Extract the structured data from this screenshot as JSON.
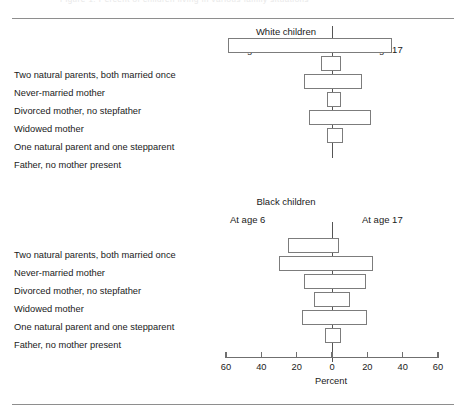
{
  "figure": {
    "faint_header": "Figure 1. Percent of children living in various family situations",
    "axis_title": "Percent"
  },
  "categories": [
    "Two natural parents, both married once",
    "Never-married mother",
    "Divorced mother, no stepfather",
    "Widowed mother",
    "One natural parent and one stepparent",
    "Father, no mother present"
  ],
  "panels": [
    {
      "key": "white",
      "title": "White children",
      "left_label": "At age 6",
      "right_label": "At age 17"
    },
    {
      "key": "black",
      "title": "Black children",
      "left_label": "At age 6",
      "right_label": "At age 17"
    }
  ],
  "axis": {
    "tick_labels": [
      "60",
      "40",
      "20",
      "0",
      "20",
      "40",
      "60"
    ],
    "tick_values": [
      -60,
      -40,
      -20,
      0,
      20,
      40,
      60
    ],
    "min": -60,
    "max": 60,
    "title": "Percent"
  },
  "colors": {
    "bar_stroke": "#7c7c7c",
    "bar_fill": "#ffffff",
    "axis": "#6f6f6f",
    "rule": "#8e8e8e",
    "text": "#1a1a1a"
  },
  "chart_data": {
    "type": "bar",
    "orientation": "horizontal-diverging",
    "title": "Percent of children living in various family situations",
    "xlabel": "Percent",
    "ylabel": "",
    "xlim": [
      -60,
      60
    ],
    "grid": false,
    "legend": "inline panel labels (At age 6 on left, At age 17 on right)",
    "categories": [
      "Two natural parents, both married once",
      "Never-married mother",
      "Divorced mother, no stepfather",
      "Widowed mother",
      "One natural parent and one stepparent",
      "Father, no mother present"
    ],
    "panels": [
      {
        "name": "White children",
        "series": [
          {
            "name": "At age 6",
            "side": "left",
            "values": [
              59,
              6,
              16,
              3,
              13,
              3
            ]
          },
          {
            "name": "At age 17",
            "side": "right",
            "values": [
              34,
              5,
              17,
              5,
              22,
              6
            ]
          }
        ]
      },
      {
        "name": "Black children",
        "series": [
          {
            "name": "At age 6",
            "side": "left",
            "values": [
              25,
              30,
              16,
              10,
              17,
              4
            ]
          },
          {
            "name": "At age 17",
            "side": "right",
            "values": [
              4,
              23,
              19,
              10,
              20,
              5
            ]
          }
        ]
      }
    ]
  }
}
